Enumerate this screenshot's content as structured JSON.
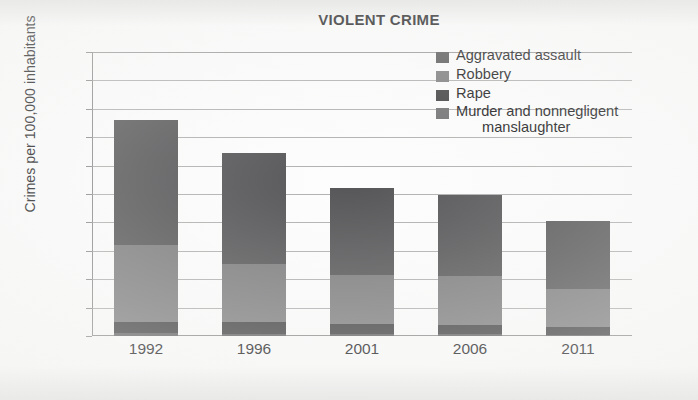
{
  "chart_data": {
    "type": "bar",
    "subtype": "stacked-vertical",
    "title": "VIOLENT CRIME",
    "xlabel": "",
    "ylabel": "Crimes per 100,000 inhabitants",
    "categories": [
      "1992",
      "1996",
      "2001",
      "2006",
      "2011"
    ],
    "ylim": [
      0,
      1000
    ],
    "ytick_step": 100,
    "yticks": [
      "1000",
      "900",
      "800",
      "700",
      "600",
      "500",
      "400",
      "300",
      "200",
      "100",
      "0"
    ],
    "grid": true,
    "legend_position": "top-right",
    "series": [
      {
        "name": "Murder and nonnegligent manslaughter",
        "color": "#6e6e70",
        "values": [
          10,
          8,
          6,
          6,
          5
        ]
      },
      {
        "name": "Rape",
        "color": "#3c3c3e",
        "values": [
          40,
          40,
          36,
          32,
          28
        ]
      },
      {
        "name": "Robbery",
        "color": "#7b7b7d",
        "values": [
          270,
          207,
          173,
          172,
          132
        ]
      },
      {
        "name": "Aggravated assault",
        "color": "#555557",
        "values": [
          440,
          390,
          305,
          285,
          240
        ]
      }
    ],
    "totals": [
      760,
      645,
      520,
      495,
      405
    ],
    "segment_tops": {
      "murder": [
        10,
        8,
        6,
        6,
        5
      ],
      "rape": [
        50,
        48,
        42,
        38,
        33
      ],
      "robbery": [
        320,
        255,
        215,
        210,
        165
      ],
      "assault": [
        760,
        645,
        520,
        495,
        405
      ]
    },
    "legend": [
      {
        "label": "Aggravated assault",
        "color": "#555557",
        "swatch": "legend-swatch-aggravated-assault"
      },
      {
        "label": "Robbery",
        "color": "#7b7b7d",
        "swatch": "legend-swatch-robbery"
      },
      {
        "label": "Rape",
        "color": "#3c3c3e",
        "swatch": "legend-swatch-rape"
      },
      {
        "label": "Murder and nonnegligent",
        "label_line2": "manslaughter",
        "color": "#6e6e70",
        "swatch": "legend-swatch-murder"
      }
    ]
  }
}
